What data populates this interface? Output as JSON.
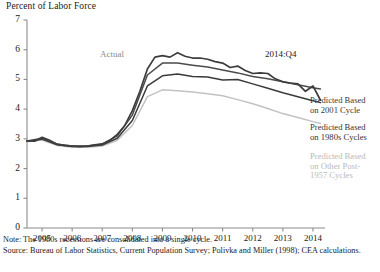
{
  "figure": {
    "y_axis_title": "Percent of Labor Force",
    "annotations": {
      "actual": "Actual",
      "date": "2014:Q4"
    },
    "legend": [
      {
        "line1": "Predicted Based",
        "line2": "on 2001 Cycle",
        "color": "#4a4a4a"
      },
      {
        "line1": "Predicted Based",
        "line2": "on 1980s Cycles",
        "color": "#3a3a3a"
      },
      {
        "line1": "Predicted Based",
        "line2": "on Other Post-",
        "line3": "1957 Cycles",
        "color": "#c2c2c2"
      }
    ],
    "note": "Note: The 1980s recessions are consolidated into a single cycle.",
    "source": "Source: Bureau of Labor Statistics, Current Population Survey; Polivka and Miller (1998); CEA calculations."
  },
  "chart_data": {
    "type": "line",
    "title": "",
    "xlabel": "",
    "ylabel": "Percent of Labor Force",
    "xlim": [
      2005.0,
      2014.9
    ],
    "ylim": [
      0,
      7
    ],
    "yticks": [
      0,
      1,
      2,
      3,
      4,
      5,
      6,
      7
    ],
    "xticks": [
      2005,
      2006,
      2007,
      2008,
      2009,
      2010,
      2011,
      2012,
      2013,
      2014
    ],
    "grid": false,
    "legend_position": "right",
    "colors": {
      "actual": "#3d3d3d",
      "cycle_2001": "#4a4a4a",
      "cycle_1980s": "#3a3a3a",
      "cycle_other": "#c2c2c2",
      "axis": "#8c8c8c",
      "annotation_gray": "#8a8a8a"
    },
    "series": [
      {
        "name": "Actual",
        "color": "#3d3d3d",
        "x": [
          2005.0,
          2005.25,
          2005.5,
          2005.75,
          2006.0,
          2006.25,
          2006.5,
          2006.75,
          2007.0,
          2007.25,
          2007.5,
          2007.75,
          2008.0,
          2008.25,
          2008.5,
          2008.75,
          2009.0,
          2009.25,
          2009.5,
          2009.75,
          2010.0,
          2010.25,
          2010.5,
          2010.75,
          2011.0,
          2011.25,
          2011.5,
          2011.75,
          2012.0,
          2012.25,
          2012.5,
          2012.75,
          2013.0,
          2013.25,
          2013.5,
          2013.75,
          2014.0,
          2014.25,
          2014.5,
          2014.75
        ],
        "y": [
          2.93,
          2.92,
          3.05,
          2.95,
          2.82,
          2.78,
          2.76,
          2.74,
          2.76,
          2.8,
          2.83,
          2.95,
          3.15,
          3.45,
          3.95,
          4.6,
          5.35,
          5.75,
          5.8,
          5.75,
          5.9,
          5.78,
          5.72,
          5.72,
          5.68,
          5.6,
          5.55,
          5.4,
          5.45,
          5.3,
          5.2,
          5.22,
          5.2,
          5.02,
          4.92,
          4.88,
          4.85,
          4.6,
          4.78,
          4.3
        ]
      },
      {
        "name": "Predicted Based on 2001 Cycle",
        "color": "#4a4a4a",
        "x": [
          2005.0,
          2005.5,
          2006.0,
          2006.5,
          2007.0,
          2007.5,
          2008.0,
          2008.5,
          2009.0,
          2009.5,
          2010.0,
          2010.5,
          2011.0,
          2011.5,
          2012.0,
          2012.5,
          2013.0,
          2013.5,
          2014.0,
          2014.5,
          2014.75
        ],
        "y": [
          2.93,
          3.02,
          2.82,
          2.76,
          2.76,
          2.82,
          3.1,
          3.8,
          5.15,
          5.55,
          5.55,
          5.48,
          5.42,
          5.32,
          5.22,
          5.1,
          5.02,
          4.92,
          4.82,
          4.72,
          4.68
        ]
      },
      {
        "name": "Predicted Based on 1980s Cycles",
        "color": "#3a3a3a",
        "x": [
          2005.0,
          2005.5,
          2006.0,
          2006.5,
          2007.0,
          2007.5,
          2008.0,
          2008.5,
          2009.0,
          2009.5,
          2010.0,
          2010.5,
          2011.0,
          2011.5,
          2012.0,
          2012.5,
          2013.0,
          2013.5,
          2014.0,
          2014.5,
          2014.75
        ],
        "y": [
          2.92,
          2.99,
          2.8,
          2.74,
          2.74,
          2.79,
          3.02,
          3.62,
          4.78,
          5.12,
          5.18,
          5.1,
          5.08,
          4.98,
          5.0,
          4.85,
          4.7,
          4.55,
          4.42,
          4.28,
          4.22
        ]
      },
      {
        "name": "Predicted Based on Other Post-1957 Cycles",
        "color": "#c2c2c2",
        "x": [
          2005.0,
          2005.5,
          2006.0,
          2006.5,
          2007.0,
          2007.5,
          2008.0,
          2008.5,
          2009.0,
          2009.5,
          2010.0,
          2010.5,
          2011.0,
          2011.5,
          2012.0,
          2012.5,
          2013.0,
          2013.5,
          2014.0,
          2014.5,
          2014.75
        ],
        "y": [
          2.9,
          2.96,
          2.78,
          2.72,
          2.72,
          2.76,
          2.95,
          3.45,
          4.42,
          4.65,
          4.62,
          4.58,
          4.52,
          4.45,
          4.32,
          4.18,
          4.02,
          3.85,
          3.72,
          3.58,
          3.52
        ]
      }
    ]
  }
}
